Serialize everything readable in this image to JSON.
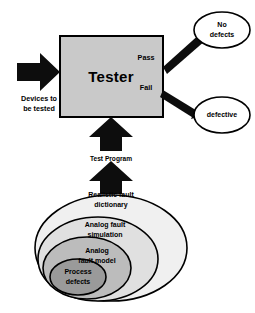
{
  "diagram": {
    "tester": {
      "label": "Tester",
      "fill_color": "#c9c9c9",
      "border_color": "#000000"
    },
    "input": {
      "label_line1": "Devices to",
      "label_line2": "be tested",
      "arrow_direction": "right"
    },
    "program": {
      "label": "Test Program",
      "arrow_direction": "up"
    },
    "outputs": [
      {
        "branch_label": "Pass",
        "result_line1": "No",
        "result_line2": "defects"
      },
      {
        "branch_label": "Fail",
        "result_line1": "defective",
        "result_line2": ""
      }
    ],
    "hierarchy": {
      "description": "Nested fault abstraction levels, outermost to innermost",
      "levels": [
        {
          "line1": "Realistic fault",
          "line2": "dictionary",
          "fill_color": "#f0f0f0"
        },
        {
          "line1": "Analog fault",
          "line2": "simulation",
          "fill_color": "#e0e0e0"
        },
        {
          "line1": "Analog",
          "line2": "fault model",
          "fill_color": "#bcbcbc"
        },
        {
          "line1": "Process",
          "line2": "defects",
          "fill_color": "#9a9a9a"
        }
      ]
    }
  }
}
